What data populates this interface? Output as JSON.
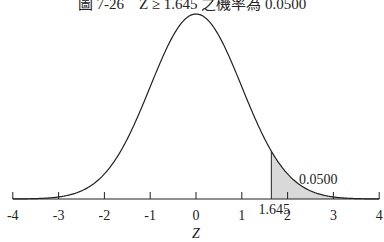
{
  "title": "圖 7-26　Z ≥ 1.645 之機率為 0.0500",
  "chart_data": {
    "type": "area",
    "title": "圖 7-26　Z ≥ 1.645 之機率為 0.0500",
    "distribution": "standard normal",
    "xlabel": "Z",
    "ylabel": "",
    "xlim": [
      -4,
      4
    ],
    "x_ticks": [
      -4,
      -3,
      -2,
      -1,
      0,
      1,
      2,
      3,
      4
    ],
    "tick_labels": [
      "-4",
      "-3",
      "-2",
      "-1",
      "0",
      "1",
      "2",
      "3",
      "4"
    ],
    "shaded_region": {
      "from": 1.645,
      "to": 4,
      "color": "#d9d9d9"
    },
    "annotations": [
      {
        "text": "1.645",
        "x": 1.645,
        "position": "below axis"
      },
      {
        "text": "0.0500",
        "x": 2.6,
        "position": "tail area label"
      }
    ],
    "grid": false,
    "legend": null
  }
}
